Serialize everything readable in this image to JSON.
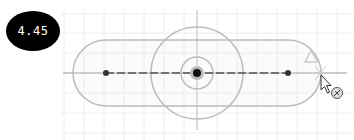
{
  "dimension_badge": {
    "value": "4.45"
  },
  "sketch": {
    "grid_color": "#ececec",
    "geometry_color": "#b8b8b8",
    "axis_color": "#9a9a9a",
    "point_color": "#333333",
    "origin_color": "#111111"
  },
  "icons": {
    "cursor": "arrow-cursor-icon",
    "tool": "dimension-tool-icon",
    "constraint": "triangle-constraint-glyph"
  }
}
